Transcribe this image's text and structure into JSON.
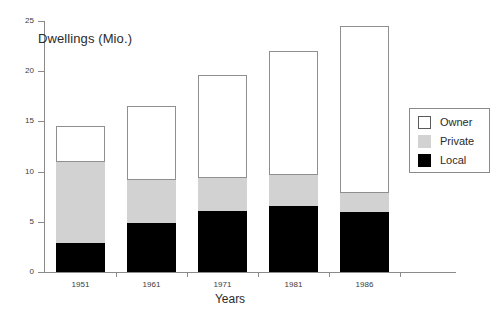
{
  "chart_data": {
    "type": "bar",
    "stacked": true,
    "title": "Dwellings (Mio.)",
    "xlabel": "Years",
    "ylabel": "",
    "categories": [
      "1951",
      "1961",
      "1971",
      "1981",
      "1986"
    ],
    "ylim": [
      0,
      25
    ],
    "yticks": [
      0,
      5,
      10,
      15,
      20,
      25
    ],
    "ytick_labels": [
      "0",
      "5",
      "10",
      "15",
      "20",
      "25"
    ],
    "grid": false,
    "legend_position": "right",
    "series": [
      {
        "name": "Local",
        "color": "#000000",
        "values": [
          2.9,
          4.9,
          6.1,
          6.6,
          6.0
        ]
      },
      {
        "name": "Private",
        "color": "#d2d2d2",
        "values": [
          8.1,
          4.3,
          3.3,
          3.1,
          1.9
        ]
      },
      {
        "name": "Owner",
        "color": "#ffffff",
        "values": [
          3.5,
          7.3,
          10.2,
          12.3,
          16.6
        ]
      }
    ],
    "cumulative_tops": {
      "local": [
        2.9,
        4.9,
        6.1,
        6.6,
        6.0
      ],
      "private": [
        11.0,
        9.2,
        9.4,
        9.7,
        7.9
      ],
      "owner": [
        14.5,
        16.5,
        19.6,
        22.0,
        24.5
      ]
    },
    "totals": [
      14.5,
      16.5,
      19.6,
      22.0,
      24.5
    ]
  },
  "legend": {
    "items": [
      {
        "label": "Owner",
        "swatch": "legend-swatch-owner"
      },
      {
        "label": "Private",
        "swatch": "legend-swatch-private"
      },
      {
        "label": "Local",
        "swatch": "legend-swatch-local"
      }
    ]
  },
  "axes": {
    "y_labels": [
      "25",
      "20",
      "15",
      "10",
      "5",
      "0"
    ],
    "x_labels": [
      "1951",
      "1961",
      "1971",
      "1981",
      "1986"
    ],
    "x_title": "Years"
  },
  "colors": {
    "owner": "#ffffff",
    "private": "#d2d2d2",
    "local": "#000000",
    "axis": "#8a8a8a",
    "text": "#2b2b2b",
    "background": "#ffffff"
  }
}
